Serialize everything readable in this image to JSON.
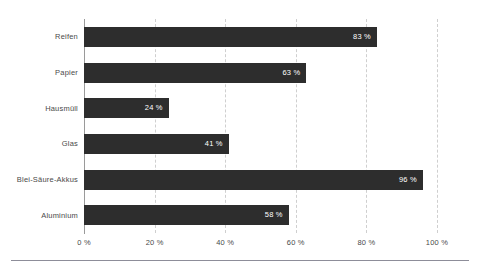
{
  "chart_data": {
    "type": "bar",
    "orientation": "horizontal",
    "title": "",
    "subtitle": "",
    "xlabel": "",
    "ylabel": "",
    "categories": [
      "Reifen",
      "Papier",
      "Hausmüll",
      "Glas",
      "Blei-Säure-Akkus",
      "Aluminium"
    ],
    "values": [
      83,
      63,
      24,
      41,
      96,
      58
    ],
    "value_labels": [
      "83 %",
      "63 %",
      "24 %",
      "41 %",
      "96 %",
      "58 %"
    ],
    "xlim": [
      0,
      100
    ],
    "xticks": [
      0,
      20,
      40,
      60,
      80,
      100
    ],
    "xtick_labels": [
      "0 %",
      "20 %",
      "40 %",
      "60 %",
      "80 %",
      "100 %"
    ],
    "grid": true,
    "grid_axis": "x",
    "grid_style": "dashed",
    "legend": null,
    "legend_position": "none",
    "series": [
      {
        "name": "Recyclingquote",
        "values": [
          83,
          63,
          24,
          41,
          96,
          58
        ]
      }
    ]
  },
  "style": {
    "bar_color": "#2d2d2d",
    "value_label_color": "#ffffff",
    "tick_label_color": "#4a4a4a",
    "gridline_color": "#cfcfcf",
    "axis_color": "#9a9a9a",
    "rule_color": "#8d8d99",
    "background": "#ffffff"
  }
}
